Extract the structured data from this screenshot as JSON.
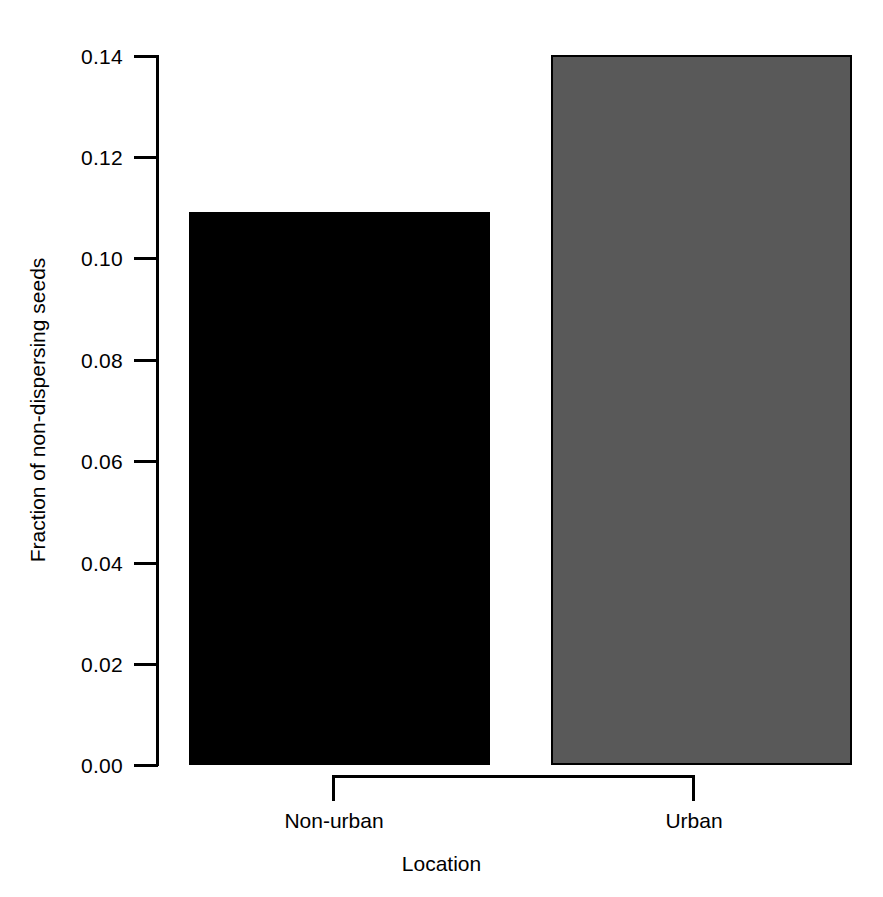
{
  "chart_data": {
    "type": "bar",
    "title": "",
    "subtitle": "",
    "xlabel": "Location",
    "ylabel": "Fraction of non-dispersing seeds",
    "categories": [
      "Non-urban",
      "Urban"
    ],
    "values": [
      0.109,
      0.14
    ],
    "series": [
      {
        "name": "Fraction of non-dispersing seeds",
        "values": [
          0.109,
          0.14
        ]
      }
    ],
    "bar_colors": [
      "#000000",
      "#595959"
    ],
    "ylim": [
      0.0,
      0.14
    ],
    "yticks": [
      0.0,
      0.02,
      0.04,
      0.06,
      0.08,
      0.1,
      0.12,
      0.14
    ],
    "ytick_labels": [
      "0.00",
      "0.02",
      "0.04",
      "0.06",
      "0.08",
      "0.10",
      "0.12",
      "0.14"
    ],
    "grid": false,
    "legend": false,
    "legend_position": "none",
    "axis_style": "bracket",
    "background": "#ffffff",
    "foreground": "#000000"
  },
  "axes": {
    "y": {
      "title": "Fraction of non-dispersing seeds",
      "labels": [
        "0.14",
        "0.12",
        "0.10",
        "0.08",
        "0.06",
        "0.04",
        "0.02",
        "0.00"
      ]
    },
    "x": {
      "title": "Location",
      "labels": [
        "Non-urban",
        "Urban"
      ]
    }
  }
}
